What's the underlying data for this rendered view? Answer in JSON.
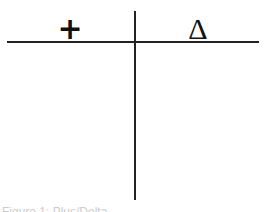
{
  "chart": {
    "left_header": "+",
    "right_header": "Δ",
    "left_label": "plus",
    "right_label": "delta"
  },
  "caption": "Figure 1: Plus/Delta"
}
